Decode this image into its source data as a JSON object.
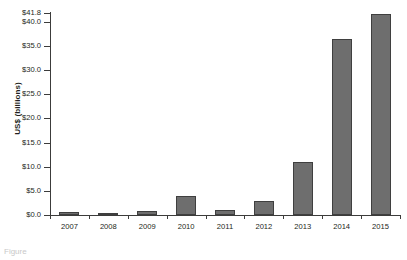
{
  "chart_data": {
    "type": "bar",
    "title": "",
    "xlabel": "",
    "ylabel": "US$ (billions)",
    "categories": [
      "2007",
      "2008",
      "2009",
      "2010",
      "2011",
      "2012",
      "2013",
      "2014",
      "2015"
    ],
    "values": [
      0.7,
      0.3,
      0.8,
      3.9,
      1.1,
      2.9,
      11.0,
      36.4,
      41.5
    ],
    "ylim": [
      0.0,
      41.8
    ],
    "ytick_values": [
      0.0,
      5.0,
      10.0,
      15.0,
      20.0,
      25.0,
      30.0,
      35.0,
      40.0,
      41.8
    ],
    "ytick_labels": [
      "$0.0",
      "$5.0",
      "$10.0",
      "$15.0",
      "$20.0",
      "$25.0",
      "$30.0",
      "$35.0",
      "$40.0",
      "$41.8"
    ],
    "grid": false,
    "legend": null,
    "legend_position": "none",
    "bar_color": "#6e6e6e",
    "bar_edge_color": "#3f3f3f",
    "axis_color": "#3c3c3b",
    "background_color": "#ffffff"
  },
  "caption": {
    "text": "Figure"
  }
}
